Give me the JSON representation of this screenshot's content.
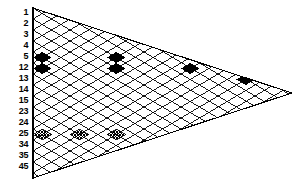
{
  "figure": {
    "background_color": "#ffffff",
    "line_color": "#000000",
    "fill_black": "#000000",
    "fill_hatch": "#555555"
  },
  "axis": {
    "orientation": "vertical-left",
    "labels": [
      {
        "text": "1",
        "y": 13
      },
      {
        "text": "2",
        "y": 24
      },
      {
        "text": "3",
        "y": 35
      },
      {
        "text": "4",
        "y": 46
      },
      {
        "text": "5",
        "y": 57
      },
      {
        "text": "12",
        "y": 68
      },
      {
        "text": "13",
        "y": 79
      },
      {
        "text": "14",
        "y": 90
      },
      {
        "text": "15",
        "y": 101
      },
      {
        "text": "23",
        "y": 112
      },
      {
        "text": "24",
        "y": 123
      },
      {
        "text": "25",
        "y": 134
      },
      {
        "text": "34",
        "y": 145
      },
      {
        "text": "35",
        "y": 156
      },
      {
        "text": "45",
        "y": 167
      }
    ]
  },
  "chart_data": {
    "type": "heatmap",
    "title": "",
    "xlabel": "",
    "ylabel": "",
    "grid": true,
    "legend": "none",
    "shape": "right-pointing-triangle",
    "geometry": {
      "left_x": 33,
      "apex_x": 292,
      "top_y": 8,
      "bottom_y": 178,
      "apex_y": 93,
      "cell_w": 18.5,
      "cell_h": 11.0,
      "rows": 15,
      "cols": 14
    },
    "categories": [
      "1",
      "2",
      "3",
      "4",
      "5",
      "12",
      "13",
      "14",
      "15",
      "23",
      "24",
      "25",
      "34",
      "35",
      "45"
    ],
    "cells": [
      {
        "row": "5",
        "col": 1,
        "fill": "black"
      },
      {
        "row": "5",
        "col": 5,
        "fill": "black"
      },
      {
        "row": "12",
        "col": 1,
        "fill": "black"
      },
      {
        "row": "12",
        "col": 5,
        "fill": "black"
      },
      {
        "row": "12",
        "col": 9,
        "fill": "black"
      },
      {
        "row": "13",
        "col": 12,
        "fill": "black"
      },
      {
        "row": "25",
        "col": 1,
        "fill": "hatch"
      },
      {
        "row": "25",
        "col": 3,
        "fill": "hatch"
      },
      {
        "row": "25",
        "col": 5,
        "fill": "hatch"
      }
    ],
    "values": [
      0,
      0,
      0,
      0,
      2,
      3,
      1,
      0,
      0,
      0,
      0,
      3,
      0,
      0,
      0
    ]
  }
}
